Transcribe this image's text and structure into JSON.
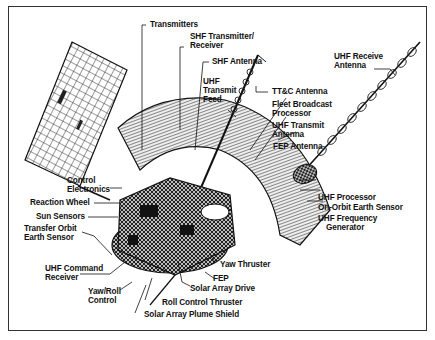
{
  "diagram": {
    "type": "labeled-technical-illustration",
    "labels": [
      {
        "id": "transmitters",
        "text": "Transmitters"
      },
      {
        "id": "shf-transmitter-receiver",
        "line1": "SHF Transmitter/",
        "line2": "Receiver"
      },
      {
        "id": "shf-antenna",
        "text": "SHF Antenna"
      },
      {
        "id": "uhf-transmit-feed",
        "line1": "UHF",
        "line2": "Transmit",
        "line3": "Feed"
      },
      {
        "id": "ttc-antenna",
        "text": "TT&C Antenna"
      },
      {
        "id": "uhf-receive-antenna",
        "line1": "UHF Receive",
        "line2": "Antenna"
      },
      {
        "id": "fleet-broadcast-processor",
        "line1": "Fleet Broadcast",
        "line2": "Processor"
      },
      {
        "id": "uhf-transmit-antenna",
        "line1": "UHF Transmit",
        "line2": "Antenna"
      },
      {
        "id": "fep-antenna",
        "text": "FEP Antenna"
      },
      {
        "id": "uhf-processor",
        "text": "UHF Processor"
      },
      {
        "id": "on-orbit-earth-sensor",
        "text": "On-Orbit Earth Sensor"
      },
      {
        "id": "uhf-frequency-generator",
        "line1": "UHF Frequency",
        "line2": "Generator"
      },
      {
        "id": "control-electronics",
        "line1": "Control",
        "line2": "Electronics"
      },
      {
        "id": "reaction-wheel",
        "text": "Reaction Wheel"
      },
      {
        "id": "sun-sensors",
        "text": "Sun Sensors"
      },
      {
        "id": "transfer-orbit-earth-sensor",
        "line1": "Transfer Orbit",
        "line2": "Earth Sensor"
      },
      {
        "id": "uhf-command-receiver",
        "line1": "UHF Command",
        "line2": "Receiver"
      },
      {
        "id": "yaw-roll-control",
        "line1": "Yaw/Roll",
        "line2": "Control"
      },
      {
        "id": "yaw-thruster",
        "text": "Yaw Thruster"
      },
      {
        "id": "fep",
        "text": "FEP"
      },
      {
        "id": "solar-array-drive",
        "text": "Solar Array Drive"
      },
      {
        "id": "roll-control-thruster",
        "text": "Roll Control Thruster"
      },
      {
        "id": "solar-array-plume-shield",
        "text": "Solar Array Plume Shield"
      }
    ]
  }
}
